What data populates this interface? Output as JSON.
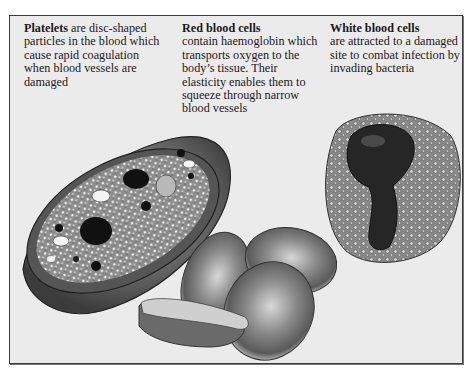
{
  "captions": {
    "platelets": {
      "title": "Platelets",
      "body": " are disc-shaped particles in the blood which cause rapid coagulation when blood vessels are damaged"
    },
    "red_blood_cells": {
      "title": "Red blood cells",
      "body": "contain haemoglobin which transports oxygen to the body’s tissue. Their elasticity enables them to squeeze through narrow blood vessels"
    },
    "white_blood_cells": {
      "title": "White blood cells",
      "body": "are attracted to a damaged site to combat infection by invading bacteria"
    }
  },
  "illustrations": {
    "platelet": "platelet-cross-section",
    "red_cells": "red-blood-cells-group",
    "white_cell": "white-blood-cell"
  },
  "colors": {
    "panel_bg": "#ebebeb",
    "border": "#3a3a3a",
    "ink": "#1a1a1a"
  }
}
